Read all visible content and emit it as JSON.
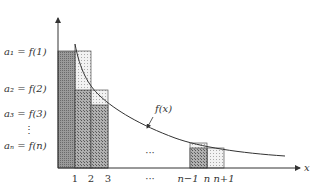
{
  "diagram": {
    "y_labels": [
      {
        "text": "a₁ = f(1)",
        "y": 55
      },
      {
        "text": "a₂ = f(2)",
        "y": 92
      },
      {
        "text": "a₃ = f(3)",
        "y": 117
      },
      {
        "text": "⋮",
        "y": 133
      },
      {
        "text": "aₙ = f(n)",
        "y": 149
      }
    ],
    "x_ticks": [
      {
        "text": "1",
        "x": 75
      },
      {
        "text": "2",
        "x": 91
      },
      {
        "text": "3",
        "x": 108
      },
      {
        "text": "···",
        "x": 150
      },
      {
        "text": "n−1",
        "x": 190
      },
      {
        "text": "n",
        "x": 207
      },
      {
        "text": "n+1",
        "x": 224
      }
    ],
    "middle_dots": "···",
    "curve_label": "f(x)",
    "x_axis_label": "x",
    "colors": {
      "dark_fill": "#8a8a8a",
      "medium_fill": "#a5a5a5",
      "light_fill": "#e4e4e4",
      "stroke": "#444444"
    }
  }
}
